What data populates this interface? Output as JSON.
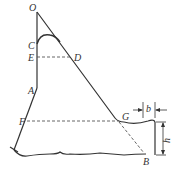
{
  "diagram": {
    "type": "geometry-physics-figure",
    "points": {
      "O": "O",
      "C": "C",
      "E": "E",
      "D": "D",
      "A": "A",
      "F": "F",
      "G": "G",
      "B": "B"
    },
    "dimensions": {
      "width_label": "b",
      "height_label": "h"
    },
    "colors": {
      "stroke": "#333333",
      "dashed": "#555555",
      "background": "#ffffff"
    }
  }
}
